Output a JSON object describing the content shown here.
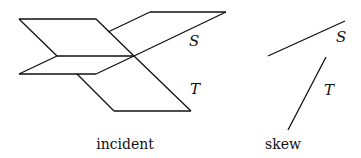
{
  "diagram": {
    "incident": {
      "caption": "incident",
      "plane_s_label": "S",
      "plane_t_label": "T"
    },
    "skew": {
      "caption": "skew",
      "line_s_label": "S",
      "line_t_label": "T"
    }
  }
}
